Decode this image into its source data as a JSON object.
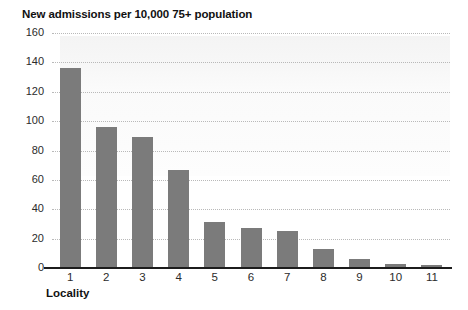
{
  "chart_data": {
    "type": "bar",
    "title": "New admissions per 10,000 75+ population",
    "xlabel": "Locality",
    "ylabel": "",
    "categories": [
      "1",
      "2",
      "3",
      "4",
      "5",
      "6",
      "7",
      "8",
      "9",
      "10",
      "11"
    ],
    "values": [
      136,
      96,
      89,
      67,
      31,
      27,
      25,
      13,
      6,
      3,
      2
    ],
    "ylim": [
      0,
      160
    ],
    "ytick_labels": [
      "160",
      "140",
      "120",
      "100",
      "80",
      "60",
      "40",
      "20",
      "0"
    ],
    "ytick_values": [
      160,
      140,
      120,
      100,
      80,
      60,
      40,
      20,
      0
    ],
    "grid": true,
    "grid_axis": "y",
    "legend": false,
    "legend_position": "none",
    "series": [
      {
        "name": "New admissions per 10,000 75+ population",
        "values": [
          136,
          96,
          89,
          67,
          31,
          27,
          25,
          13,
          6,
          3,
          2
        ]
      }
    ]
  },
  "colors": {
    "bar": "#7b7b7b",
    "gridline": "#b9b9b9",
    "axis": "#1c1c1c",
    "text": "#1a1a1a",
    "background": "#ffffff"
  }
}
